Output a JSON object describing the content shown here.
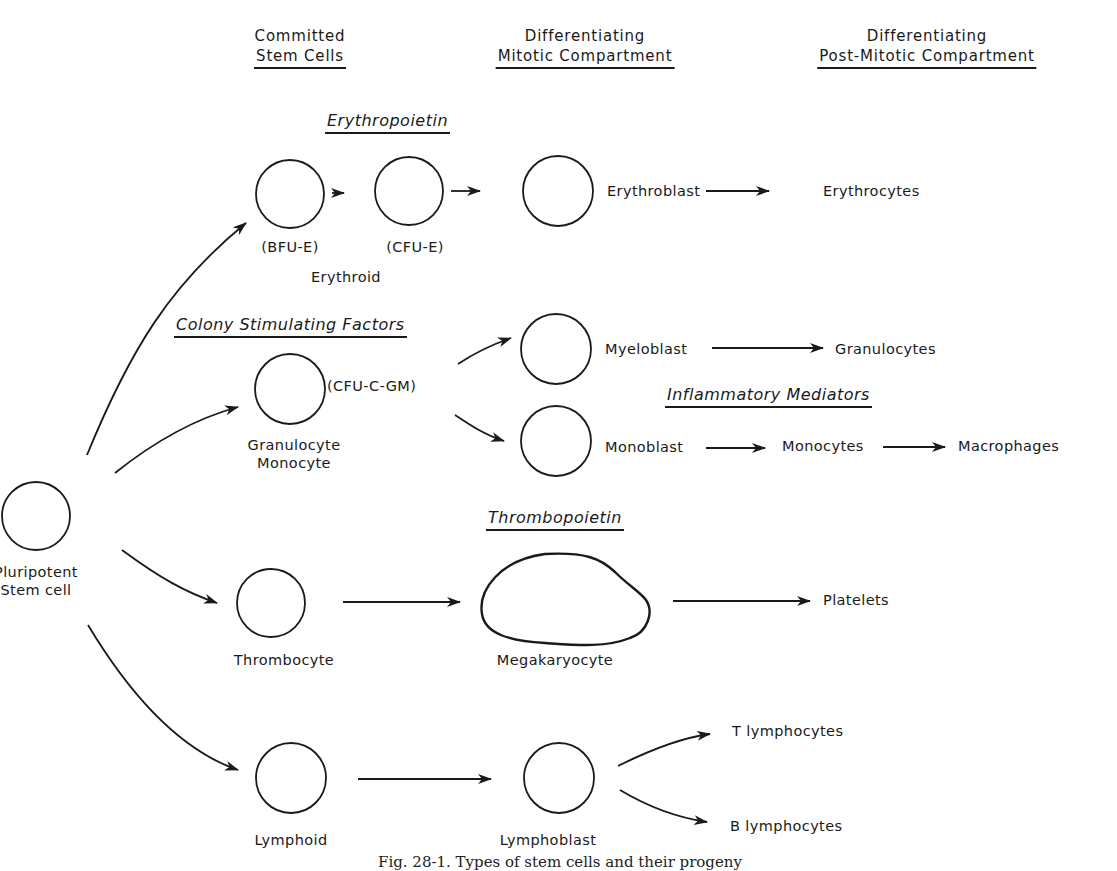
{
  "columns": {
    "committed": [
      "Committed",
      "Stem Cells"
    ],
    "mitotic": [
      "Differentiating",
      "Mitotic Compartment"
    ],
    "post_mitotic": [
      "Differentiating",
      "Post-Mitotic Compartment"
    ]
  },
  "factors": {
    "erythropoietin": "Erythropoietin",
    "csf": "Colony Stimulating Factors",
    "inflammatory": "Inflammatory Mediators",
    "thrombopoietin": "Thrombopoietin"
  },
  "cells": {
    "pluripotent": [
      "Pluripotent",
      "Stem cell"
    ],
    "bfu_e": "(BFU-E)",
    "cfu_e": "(CFU-E)",
    "erythroid": "Erythroid",
    "cfu_c_gm": "(CFU-C-GM)",
    "gran_mono": [
      "Granulocyte",
      "Monocyte"
    ],
    "thrombocyte": "Thrombocyte",
    "lymphoid": "Lymphoid",
    "erythroblast": "Erythroblast",
    "myeloblast": "Myeloblast",
    "monoblast": "Monoblast",
    "megakaryocyte": "Megakaryocyte",
    "lymphoblast": "Lymphoblast"
  },
  "products": {
    "erythrocytes": "Erythrocytes",
    "granulocytes": "Granulocytes",
    "monocytes": "Monocytes",
    "macrophages": "Macrophages",
    "platelets": "Platelets",
    "t_lymphocytes": "T  lymphocytes",
    "b_lymphocytes": "B  lymphocytes"
  },
  "caption": "Fig. 28-1.  Types of stem cells and their progeny"
}
